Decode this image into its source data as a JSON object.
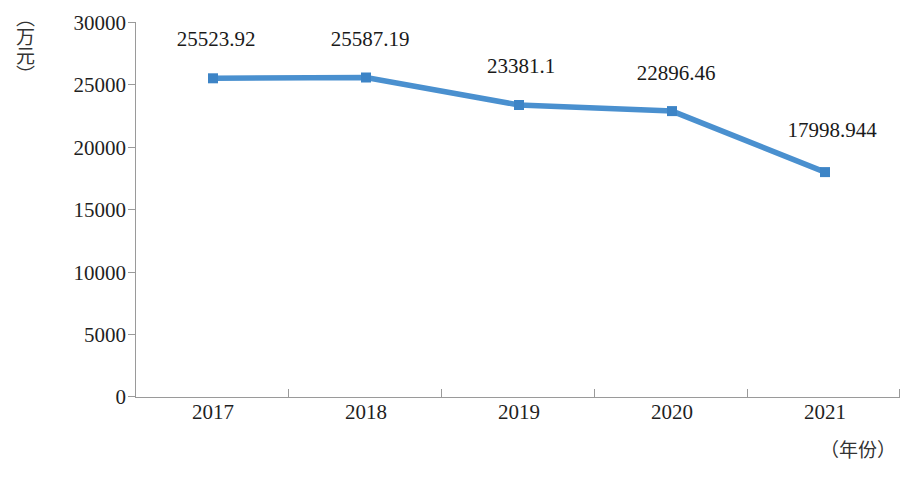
{
  "chart_data": {
    "type": "line",
    "title": "",
    "xlabel": "（年份）",
    "ylabel": "（万元）",
    "categories": [
      "2017",
      "2018",
      "2019",
      "2020",
      "2021"
    ],
    "values": [
      25523.92,
      25587.19,
      23381.1,
      22896.46,
      17998.944
    ],
    "data_labels": [
      "25523.92",
      "25587.19",
      "23381.1",
      "22896.46",
      "17998.944"
    ],
    "ylim": [
      0,
      30000
    ],
    "y_ticks": [
      "0",
      "5000",
      "10000",
      "15000",
      "20000",
      "25000",
      "30000"
    ],
    "y_tick_values": [
      0,
      5000,
      10000,
      15000,
      20000,
      25000,
      30000
    ],
    "grid": false,
    "legend": false,
    "series": [
      {
        "name": "",
        "values": [
          25523.92,
          25587.19,
          23381.1,
          22896.46,
          17998.944
        ],
        "color": "#4a90cf",
        "marker": "square"
      }
    ],
    "colors": {
      "series_line": "#4a90cf",
      "series_marker": "#3d84c6",
      "axis": "#9a9a9a",
      "text": "#1f1f1f",
      "background": "#ffffff"
    }
  }
}
